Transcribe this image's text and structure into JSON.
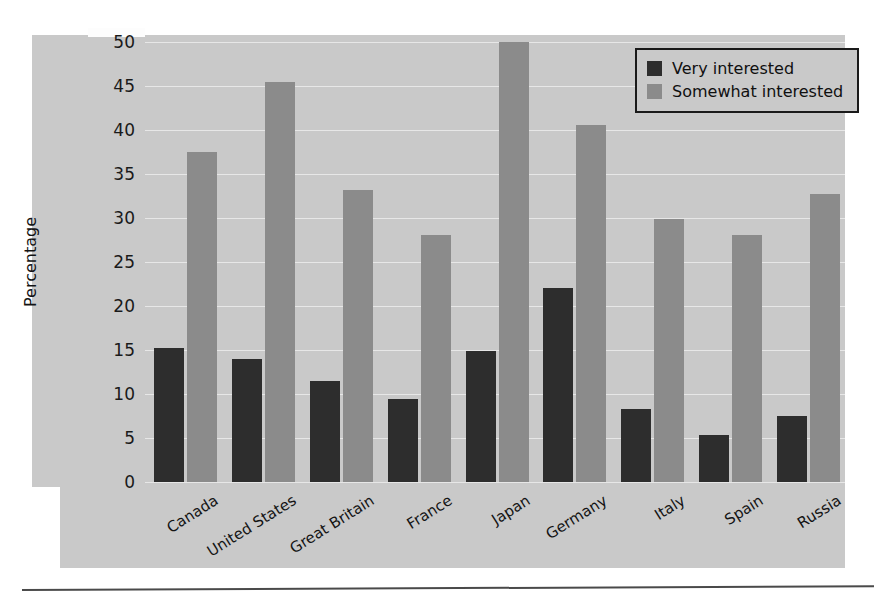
{
  "chart_data": {
    "type": "bar",
    "title": "",
    "xlabel": "",
    "ylabel": "Percentage",
    "ylim": [
      0,
      50
    ],
    "yticks": [
      0,
      5,
      10,
      15,
      20,
      25,
      30,
      35,
      40,
      45,
      50
    ],
    "ytick_labels": [
      "0",
      "5",
      "10",
      "15",
      "20",
      "25",
      "30",
      "35",
      "40",
      "45",
      "50"
    ],
    "grid": true,
    "legend_position": "top-right",
    "categories": [
      "Canada",
      "United States",
      "Great Britain",
      "France",
      "Japan",
      "Germany",
      "Italy",
      "Spain",
      "Russia"
    ],
    "series": [
      {
        "name": "Very interested",
        "color": "#2d2d2d",
        "values": [
          15.2,
          14.0,
          11.5,
          9.4,
          14.9,
          22.0,
          8.3,
          5.3,
          7.5
        ]
      },
      {
        "name": "Somewhat interested",
        "color": "#8b8b8b",
        "values": [
          37.5,
          45.5,
          33.2,
          28.1,
          50.0,
          40.6,
          29.9,
          28.1,
          32.7
        ]
      }
    ]
  },
  "legend": {
    "items": [
      {
        "label": "Very interested",
        "color": "#2d2d2d"
      },
      {
        "label": "Somewhat interested",
        "color": "#8b8b8b"
      }
    ]
  },
  "axis": {
    "y_title": "Percentage"
  },
  "colors": {
    "panel_background": "#c9c9c9",
    "page_background": "#ffffff",
    "gridline": "#ffffff",
    "text": "#141414",
    "rule": "#4a4a4a"
  }
}
